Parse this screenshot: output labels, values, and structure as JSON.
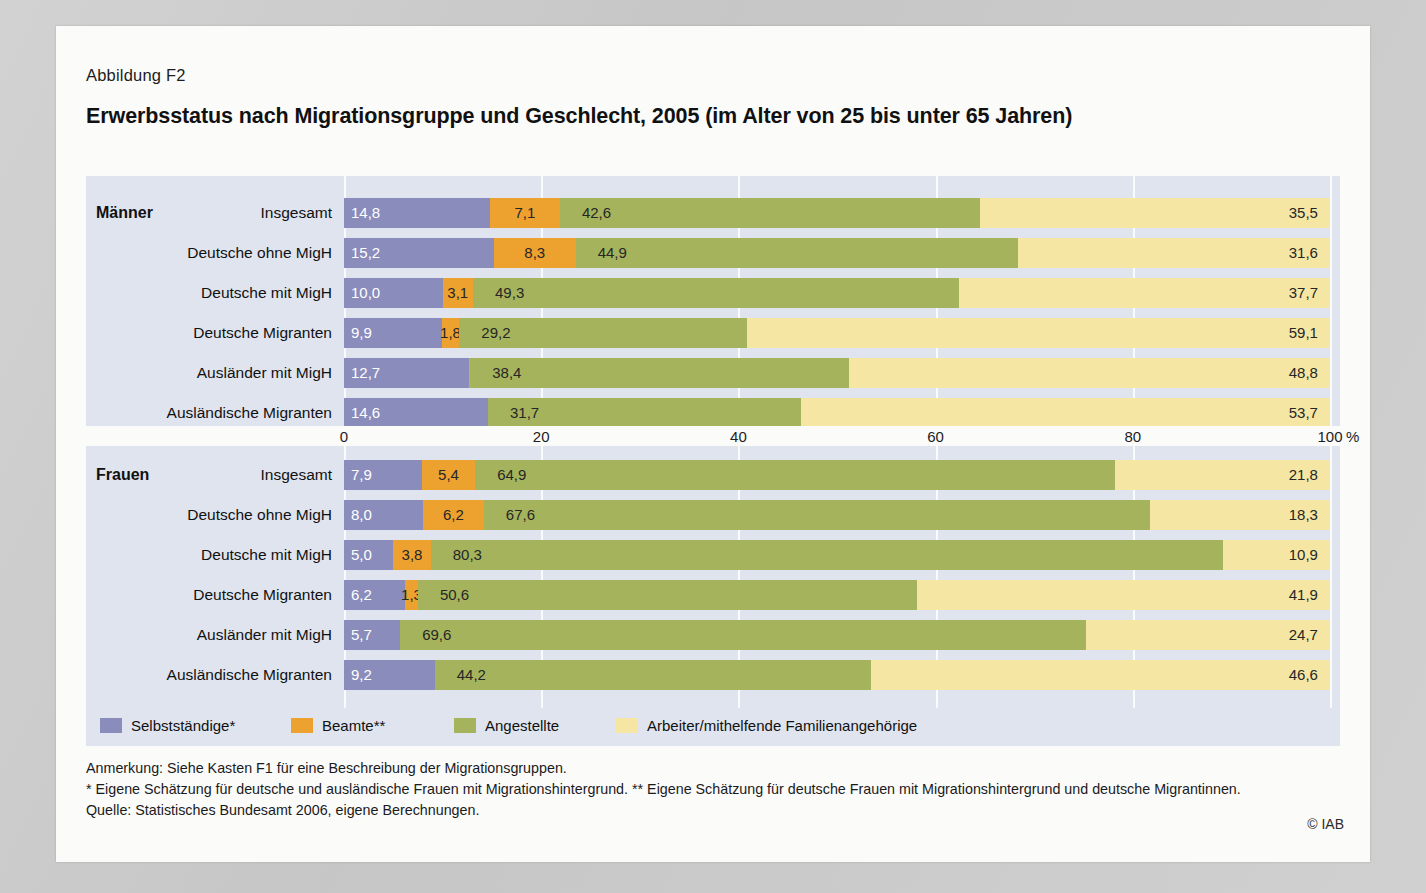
{
  "figure": {
    "number": "Abbildung F2",
    "title": "Erwerbsstatus nach Migrationsgruppe und Geschlecht, 2005 (im Alter von 25 bis unter 65 Jahren)",
    "copyright": "© IAB"
  },
  "notes": [
    "Anmerkung: Siehe Kasten F1 für eine Beschreibung der Migrationsgruppen.",
    "* Eigene Schätzung für deutsche und ausländische Frauen mit Migrationshintergrund. ** Eigene Schätzung für deutsche Frauen mit Migrationshintergrund und deutsche Migrantinnen.",
    "Quelle: Statistisches Bundesamt 2006, eigene Berechnungen."
  ],
  "groups": {
    "men": "Männer",
    "women": "Frauen"
  },
  "axis": {
    "ticks": [
      "0",
      "20",
      "40",
      "60",
      "80",
      "100"
    ],
    "unit": "%"
  },
  "legend": [
    {
      "label": "Selbstständige*",
      "color": "#8a8cbc"
    },
    {
      "label": "Beamte**",
      "color": "#eda12f"
    },
    {
      "label": "Angestellte",
      "color": "#a5b45c"
    },
    {
      "label": "Arbeiter/mithelfende Familienangehörige",
      "color": "#f6e6a4"
    }
  ],
  "chart_data": {
    "type": "bar",
    "orientation": "horizontal",
    "stacked": true,
    "normalized_percent": true,
    "title": "Erwerbsstatus nach Migrationsgruppe und Geschlecht, 2005 (im Alter von 25 bis unter 65 Jahren)",
    "xlabel": "%",
    "ylabel": "",
    "xlim": [
      0,
      100
    ],
    "xticks": [
      0,
      20,
      40,
      60,
      80,
      100
    ],
    "grid": true,
    "legend_position": "bottom",
    "series_names": [
      "Selbstständige*",
      "Beamte**",
      "Angestellte",
      "Arbeiter/mithelfende Familienangehörige"
    ],
    "series_colors": [
      "#8a8cbc",
      "#eda12f",
      "#a5b45c",
      "#f6e6a4"
    ],
    "panels": [
      {
        "name": "Männer",
        "categories": [
          "Insgesamt",
          "Deutsche ohne MigH",
          "Deutsche mit MigH",
          "Deutsche Migranten",
          "Ausländer mit MigH",
          "Ausländische Migranten"
        ],
        "rows": [
          {
            "category": "Insgesamt",
            "values": [
              14.8,
              7.1,
              42.6,
              35.5
            ],
            "labels": [
              "14,8",
              "7,1",
              "42,6",
              "35,5"
            ]
          },
          {
            "category": "Deutsche ohne MigH",
            "values": [
              15.2,
              8.3,
              44.9,
              31.6
            ],
            "labels": [
              "15,2",
              "8,3",
              "44,9",
              "31,6"
            ]
          },
          {
            "category": "Deutsche mit MigH",
            "values": [
              10.0,
              3.1,
              49.3,
              37.7
            ],
            "labels": [
              "10,0",
              "3,1",
              "49,3",
              "37,7"
            ]
          },
          {
            "category": "Deutsche Migranten",
            "values": [
              9.9,
              1.8,
              29.2,
              59.1
            ],
            "labels": [
              "9,9",
              "1,8",
              "29,2",
              "59,1"
            ]
          },
          {
            "category": "Ausländer mit MigH",
            "values": [
              12.7,
              0.1,
              38.4,
              48.8
            ],
            "labels": [
              "12,7",
              "",
              "38,4",
              "48,8"
            ]
          },
          {
            "category": "Ausländische Migranten",
            "values": [
              14.6,
              0.0,
              31.7,
              53.7
            ],
            "labels": [
              "14,6",
              "",
              "31,7",
              "53,7"
            ]
          }
        ]
      },
      {
        "name": "Frauen",
        "categories": [
          "Insgesamt",
          "Deutsche ohne MigH",
          "Deutsche mit MigH",
          "Deutsche Migranten",
          "Ausländer mit MigH",
          "Ausländische Migranten"
        ],
        "rows": [
          {
            "category": "Insgesamt",
            "values": [
              7.9,
              5.4,
              64.9,
              21.8
            ],
            "labels": [
              "7,9",
              "5,4",
              "64,9",
              "21,8"
            ]
          },
          {
            "category": "Deutsche ohne MigH",
            "values": [
              8.0,
              6.2,
              67.6,
              18.3
            ],
            "labels": [
              "8,0",
              "6,2",
              "67,6",
              "18,3"
            ]
          },
          {
            "category": "Deutsche mit MigH",
            "values": [
              5.0,
              3.8,
              80.3,
              10.9
            ],
            "labels": [
              "5,0",
              "3,8",
              "80,3",
              "10,9"
            ]
          },
          {
            "category": "Deutsche Migranten",
            "values": [
              6.2,
              1.3,
              50.6,
              41.9
            ],
            "labels": [
              "6,2",
              "1,3",
              "50,6",
              "41,9"
            ]
          },
          {
            "category": "Ausländer mit MigH",
            "values": [
              5.7,
              0.0,
              69.6,
              24.7
            ],
            "labels": [
              "5,7",
              "",
              "69,6",
              "24,7"
            ]
          },
          {
            "category": "Ausländische Migranten",
            "values": [
              9.2,
              0.0,
              44.2,
              46.6
            ],
            "labels": [
              "9,2",
              "",
              "44,2",
              "46,6"
            ]
          }
        ]
      }
    ]
  }
}
